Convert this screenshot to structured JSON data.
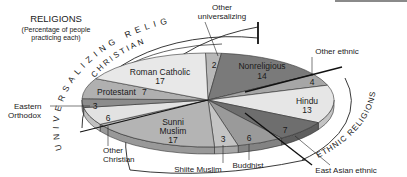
{
  "chart_data": {
    "type": "pie",
    "title": "RELIGIONS",
    "subtitle": "(Percentage of people practicing each)",
    "unit": "percent",
    "slices": [
      {
        "label": "Other universalizing",
        "value": 2,
        "color": "#b8b8b8",
        "group": "Universalizing"
      },
      {
        "label": "Nonreligious",
        "value": 14,
        "color": "#7a7a7a",
        "group": "None"
      },
      {
        "label": "Other ethnic",
        "value": 4,
        "color": "#a6a6a6",
        "group": "Ethnic"
      },
      {
        "label": "Hindu",
        "value": 13,
        "color": "#e6e6e6",
        "group": "Ethnic"
      },
      {
        "label": "East Asian ethnic",
        "value": 7,
        "color": "#6e6e6e",
        "group": "Ethnic"
      },
      {
        "label": "Buddhist",
        "value": 6,
        "color": "#9a9a9a",
        "group": "Universalizing"
      },
      {
        "label": "Shiite Muslim",
        "value": 3,
        "color": "#c4c4c4",
        "group": "Universalizing"
      },
      {
        "label": "Sunni Muslim",
        "value": 17,
        "color": "#b4b4b4",
        "group": "Universalizing"
      },
      {
        "label": "Other Christian",
        "value": 6,
        "color": "#e2e2e2",
        "group": "Christian"
      },
      {
        "label": "Eastern Orthodox",
        "value": 3,
        "color": "#8c8c8c",
        "group": "Christian"
      },
      {
        "label": "Protestant",
        "value": 7,
        "color": "#b0b0b0",
        "group": "Christian"
      },
      {
        "label": "Roman Catholic",
        "value": 17,
        "color": "#e8e8e8",
        "group": "Christian"
      }
    ],
    "group_arcs": [
      {
        "label": "UNIVERSALIZING RELIGIONS"
      },
      {
        "label": "CHRISTIAN"
      },
      {
        "label": "ETHNIC RELIGIONS"
      }
    ],
    "legend": "none (labels placed on/around slices)"
  },
  "labels": {
    "title": "RELIGIONS",
    "subtitle_line1": "(Percentage of people",
    "subtitle_line2": "practicing each)",
    "universalizing_arc": "UNIVERSALIZING RELIGIONS",
    "christian_arc": "CHRISTIAN",
    "ethnic_arc": "ETHNIC RELIGIONS",
    "other_universalizing_line1": "Other",
    "other_universalizing_line2": "universalizing",
    "other_universalizing_value": "2",
    "nonreligious": "Nonreligious",
    "nonreligious_value": "14",
    "other_ethnic": "Other ethnic",
    "other_ethnic_value": "4",
    "hindu": "Hindu",
    "hindu_value": "13",
    "east_asian": "East Asian ethnic",
    "east_asian_value": "7",
    "buddhist": "Buddhist",
    "buddhist_value": "6",
    "shiite": "Shiite Muslim",
    "shiite_value": "3",
    "sunni_line1": "Sunni",
    "sunni_line2": "Muslim",
    "sunni_value": "17",
    "other_christian_line1": "Other",
    "other_christian_line2": "Christian",
    "other_christian_value": "6",
    "eastern_orthodox_line1": "Eastern",
    "eastern_orthodox_line2": "Orthodox",
    "eastern_orthodox_value": "3",
    "protestant": "Protestant",
    "protestant_value": "7",
    "roman_catholic": "Roman Catholic",
    "roman_catholic_value": "17"
  }
}
